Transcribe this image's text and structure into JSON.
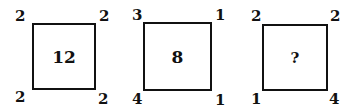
{
  "puzzle": {
    "squares": [
      {
        "center": "12",
        "corners": {
          "top_left": "2",
          "top_right": "2",
          "bottom_left": "2",
          "bottom_right": "2"
        }
      },
      {
        "center": "8",
        "corners": {
          "top_left": "3",
          "top_right": "1",
          "bottom_left": "4",
          "bottom_right": "1"
        }
      },
      {
        "center": "?",
        "corners": {
          "top_left": "2",
          "top_right": "2",
          "bottom_left": "1",
          "bottom_right": "4"
        }
      }
    ]
  }
}
